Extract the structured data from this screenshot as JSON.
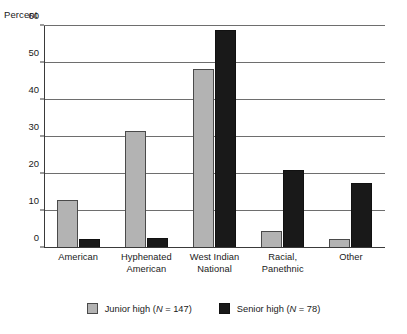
{
  "chart_data": {
    "type": "bar",
    "title": "",
    "xlabel": "",
    "ylabel": "Percent",
    "ylim": [
      0,
      60
    ],
    "yticks": [
      0,
      10,
      20,
      30,
      40,
      50,
      60
    ],
    "ytick_labels": [
      "0",
      "10",
      "20",
      "30",
      "40",
      "50",
      "60"
    ],
    "grid": true,
    "legend_position": "bottom",
    "categories": [
      "American",
      "Hyphenated American",
      "West Indian National",
      "Racial, Panethnic",
      "Other"
    ],
    "category_lines": [
      [
        "American"
      ],
      [
        "Hyphenated",
        "American"
      ],
      [
        "West Indian",
        "National"
      ],
      [
        "Racial,",
        "Panethnic"
      ],
      [
        "Other"
      ]
    ],
    "series": [
      {
        "name": "Junior high (N = 147)",
        "short_name": "Junior high",
        "n": 147,
        "color": "#b3b3b3",
        "values": [
          13.0,
          31.5,
          48.5,
          4.5,
          2.5
        ]
      },
      {
        "name": "Senior high (N = 78)",
        "short_name": "Senior high",
        "n": 78,
        "color": "#191919",
        "values": [
          2.5,
          2.8,
          59.0,
          21.0,
          17.5
        ]
      }
    ]
  },
  "legend": {
    "entries": [
      {
        "label_pre": "Junior high (",
        "label_italic": "N",
        "label_post": " = 147)"
      },
      {
        "label_pre": "Senior high (",
        "label_italic": "N",
        "label_post": " = 78)"
      }
    ]
  }
}
